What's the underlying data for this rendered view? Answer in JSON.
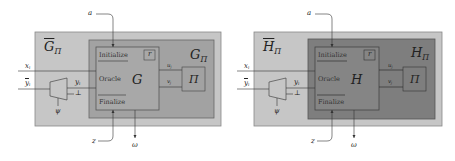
{
  "diagrams": [
    {
      "outer_label": "G",
      "outer_sub": "Π",
      "inner_label": "G",
      "inner_sub": "Π",
      "game_label": "G",
      "adversary_label": "Π",
      "randomness_label": "r",
      "sections": [
        "Initialize",
        "Oracle",
        "Finalize"
      ],
      "wires": {
        "top_input": "a",
        "bottom_input": "z",
        "output": "ω",
        "x_input": "x",
        "x_sub": "i",
        "y_input": "y",
        "y_sub": "i",
        "y_mid": "y",
        "y_mid_sub": "i",
        "bottom_out": "⊥",
        "psi": "ψ",
        "u_label": "u",
        "u_sub": "j",
        "v_label": "v",
        "v_sub": "j"
      },
      "colors": {
        "outer": "#c6c6c6",
        "inner": "#a2a2a2",
        "game": "#a8a8a8"
      }
    },
    {
      "outer_label": "H",
      "outer_sub": "Π",
      "inner_label": "H",
      "inner_sub": "Π",
      "game_label": "H",
      "adversary_label": "Π",
      "randomness_label": "r",
      "sections": [
        "Initialize",
        "Oracle",
        "Finalize"
      ],
      "wires": {
        "top_input": "a",
        "bottom_input": "z",
        "output": "ω",
        "x_input": "x",
        "x_sub": "i",
        "y_input": "y",
        "y_sub": "i",
        "y_mid": "y",
        "y_mid_sub": "i",
        "bottom_out": "⊥",
        "psi": "ψ",
        "u_label": "u",
        "u_sub": "j",
        "v_label": "v",
        "v_sub": "j"
      },
      "colors": {
        "outer": "#c6c6c6",
        "inner": "#7e7e7e",
        "game": "#858585"
      }
    }
  ]
}
